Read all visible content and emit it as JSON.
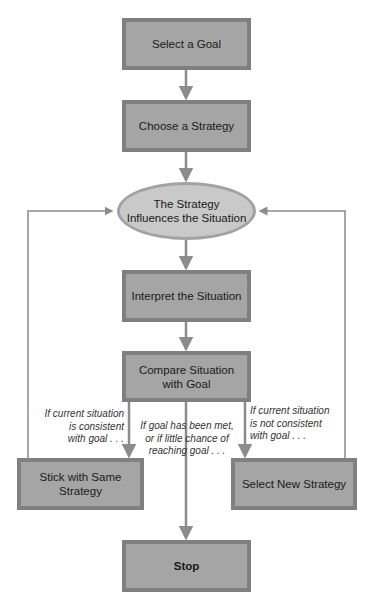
{
  "diagram": {
    "type": "flowchart",
    "colors": {
      "box_fill": "#a5a5a5",
      "box_border": "#808080",
      "ellipse_fill": "#c9c9c9",
      "ellipse_border": "#a2a2a2",
      "arrow": "#8c8c8c"
    },
    "nodes": {
      "select_goal": "Select a Goal",
      "choose_strategy": "Choose a Strategy",
      "influences_line1": "The Strategy",
      "influences_line2": "Influences the Situation",
      "interpret": "Interpret the Situation",
      "compare_line1": "Compare Situation",
      "compare_line2": "with Goal",
      "stick": "Stick with Same Strategy",
      "select_new": "Select New Strategy",
      "stop": "Stop"
    },
    "branch_labels": {
      "consistent": [
        "If current situation",
        "is consistent",
        "with goal . . ."
      ],
      "goal_met": [
        "If goal has been met,",
        "or if little chance of",
        "reaching goal . . ."
      ],
      "not_consistent": [
        "If current situation",
        "is not consistent",
        "with goal . . ."
      ]
    },
    "edges": [
      {
        "from": "Select a Goal",
        "to": "Choose a Strategy"
      },
      {
        "from": "Choose a Strategy",
        "to": "The Strategy Influences the Situation"
      },
      {
        "from": "The Strategy Influences the Situation",
        "to": "Interpret the Situation"
      },
      {
        "from": "Interpret the Situation",
        "to": "Compare Situation with Goal"
      },
      {
        "from": "Compare Situation with Goal",
        "to": "Stick with Same Strategy"
      },
      {
        "from": "Compare Situation with Goal",
        "to": "Stop"
      },
      {
        "from": "Compare Situation with Goal",
        "to": "Select New Strategy"
      },
      {
        "from": "Stick with Same Strategy",
        "to": "The Strategy Influences the Situation"
      },
      {
        "from": "Select New Strategy",
        "to": "The Strategy Influences the Situation"
      }
    ]
  }
}
